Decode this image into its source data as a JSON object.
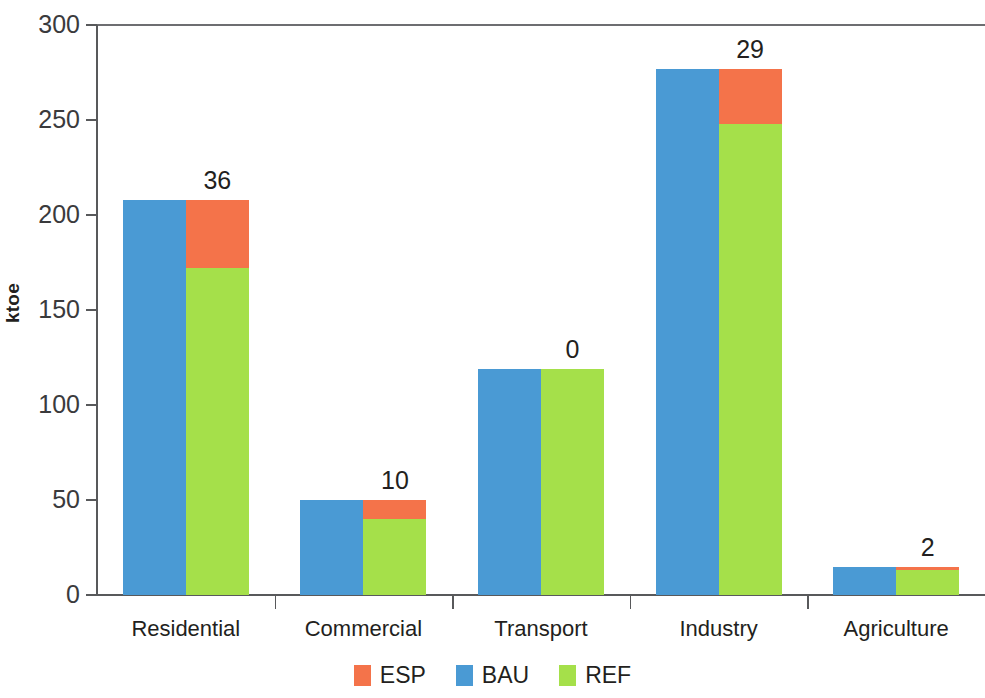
{
  "chart_data": {
    "type": "bar",
    "subtype": "grouped-stacked",
    "title": "",
    "subtitle": "",
    "xlabel": "",
    "ylabel": "ktoe",
    "ylim": [
      0,
      300
    ],
    "ytick_labels": [
      "0",
      "50",
      "100",
      "150",
      "200",
      "250",
      "300"
    ],
    "ytick_values": [
      0,
      50,
      100,
      150,
      200,
      250,
      300
    ],
    "grid": false,
    "legend_position": "bottom",
    "categories": [
      "Residential",
      "Commercial",
      "Transport",
      "Industry",
      "Agriculture"
    ],
    "series": [
      {
        "name": "BAU",
        "color": "#4a9ad4",
        "values": [
          208,
          50,
          119,
          277,
          15
        ]
      },
      {
        "name": "REF",
        "color": "#a5e04a",
        "values": [
          172,
          40,
          119,
          248,
          13
        ]
      },
      {
        "name": "ESP",
        "color": "#f4734a",
        "values": [
          36,
          10,
          0,
          29,
          2
        ]
      }
    ],
    "annotations": {
      "description": "Value printed above each category group equals the ESP increment stacked on REF",
      "labels": [
        "36",
        "10",
        "0",
        "29",
        "2"
      ]
    },
    "legend": [
      {
        "label": "ESP",
        "color": "#f4734a"
      },
      {
        "label": "BAU",
        "color": "#4a9ad4"
      },
      {
        "label": "REF",
        "color": "#a5e04a"
      }
    ],
    "colors": {
      "esp": "#f4734a",
      "bau": "#4a9ad4",
      "ref": "#a5e04a",
      "axis": "#58595b",
      "text": "#231f20",
      "background": "#ffffff"
    }
  }
}
